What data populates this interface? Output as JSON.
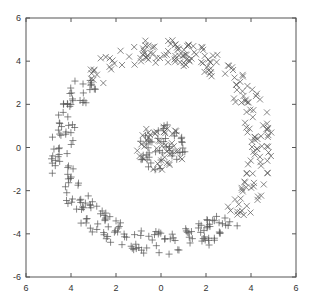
{
  "chart_data": {
    "type": "scatter",
    "title": "",
    "xlabel": "",
    "ylabel": "",
    "xlim": [
      -6,
      6
    ],
    "ylim": [
      -6,
      6
    ],
    "grid": false,
    "legend": null,
    "x_tick_labels": [
      "6",
      "4",
      "2",
      "0",
      "2",
      "4",
      "6"
    ],
    "y_tick_labels": [
      "6",
      "4",
      "2",
      "0",
      "-2",
      "-4",
      "-6"
    ],
    "tick_values": [
      -6,
      -4,
      -2,
      0,
      2,
      4,
      6
    ],
    "series": [
      {
        "name": "class-x",
        "marker": "x",
        "description": "outer ring (radius ~4 to 5) upper-right half, plus part of central cluster",
        "ring": {
          "r_min": 3.9,
          "r_max": 5.0,
          "angle_deg_min": -45,
          "angle_deg_max": 135,
          "count": 190
        },
        "center": {
          "r_max": 1.1,
          "count": 45
        }
      },
      {
        "name": "class-plus",
        "marker": "+",
        "description": "outer ring (radius ~4 to 5) lower-left half, plus part of central cluster",
        "ring": {
          "r_min": 3.9,
          "r_max": 5.0,
          "angle_deg_min": 135,
          "angle_deg_max": 315,
          "count": 190
        },
        "center": {
          "r_max": 1.1,
          "count": 45
        }
      }
    ]
  },
  "layout": {
    "plot_left": 26,
    "plot_top": 18,
    "plot_right": 296,
    "plot_bottom": 277,
    "marker_color": "#555555",
    "axis_color": "#555555"
  }
}
